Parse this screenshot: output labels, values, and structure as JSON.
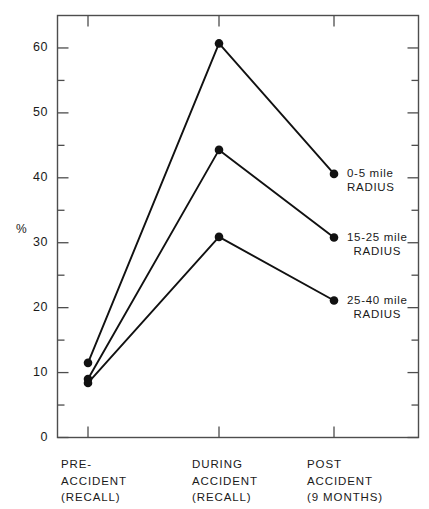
{
  "chart_data": {
    "type": "line",
    "title": "",
    "xlabel": "",
    "ylabel": "%",
    "categories": [
      "PRE-ACCIDENT (RECALL)",
      "DURING ACCIDENT (RECALL)",
      "POST ACCIDENT (9 MONTHS)"
    ],
    "category_lines": [
      [
        "PRE-",
        "ACCIDENT",
        "(RECALL)"
      ],
      [
        "DURING",
        "ACCIDENT",
        "(RECALL)"
      ],
      [
        "POST",
        "ACCIDENT",
        "(9 MONTHS)"
      ]
    ],
    "series": [
      {
        "name": "0-5 mile RADIUS",
        "label_lines": [
          "0-5 mile",
          "RADIUS"
        ],
        "values": [
          11.5,
          60.7,
          40.6
        ]
      },
      {
        "name": "15-25 mile RADIUS",
        "label_lines": [
          "15-25 mile",
          "RADIUS"
        ],
        "values": [
          9.0,
          44.3,
          30.8
        ]
      },
      {
        "name": "25-40 mile RADIUS",
        "label_lines": [
          "25-40 mile",
          "RADIUS"
        ],
        "values": [
          8.4,
          30.9,
          21.1
        ]
      }
    ],
    "ylim": [
      0,
      65
    ],
    "y_ticks_major": [
      0,
      10,
      20,
      30,
      40,
      50,
      60
    ],
    "y_tick_labels": [
      "0",
      "10",
      "20",
      "30",
      "40",
      "50",
      "60"
    ],
    "y_ticks_minor": [
      5,
      15,
      25,
      35,
      45,
      55
    ],
    "grid": false,
    "legend_position": "right-inline",
    "marker": "filled-circle",
    "line_color": "#111111",
    "axis_color": "#4d4d4d",
    "background": "#ffffff"
  }
}
